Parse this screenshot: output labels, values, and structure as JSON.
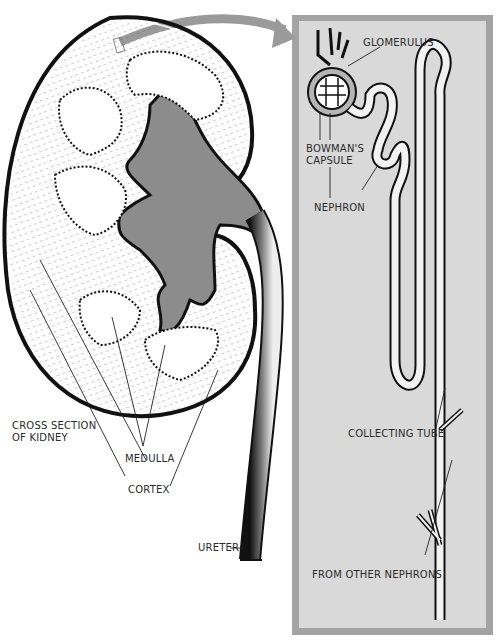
{
  "diagram": {
    "type": "anatomical illustration",
    "colors": {
      "panel_border": "#a3a3a3",
      "panel_fill": "#d9d9d9",
      "arrow": "#9a9a9a",
      "ink": "#111111",
      "pelvis_shade": "#8c8c8c"
    },
    "labels": {
      "cross_section": [
        "CROSS SECTION",
        "OF KIDNEY"
      ],
      "medulla": "MEDULLA",
      "cortex": "CORTEX",
      "ureter": "URETER",
      "glomerulus": "GLOMERULUS",
      "bowmans_capsule": [
        "BOWMAN'S",
        "CAPSULE"
      ],
      "nephron": "NEPHRON",
      "collecting_tube": "COLLECTING TUBE",
      "from_other_nephrons": "FROM OTHER NEPHRONS"
    }
  }
}
